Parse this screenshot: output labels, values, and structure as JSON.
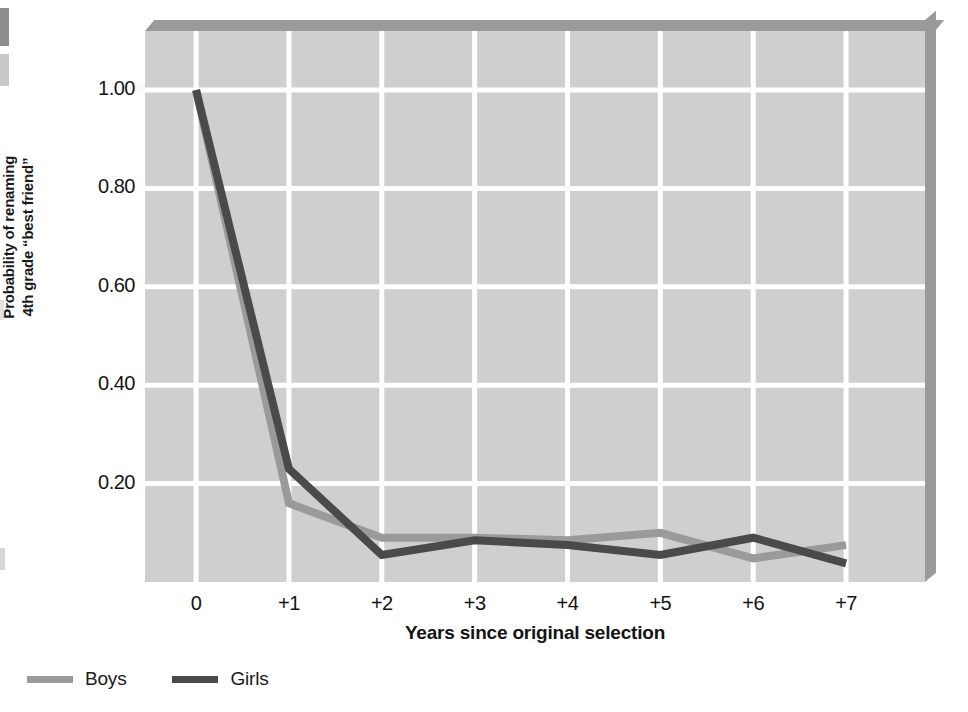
{
  "chart_data": {
    "type": "line",
    "title": "",
    "xlabel": "Years since original selection",
    "ylabel": "Probability of renaming 4th grade “best friend”",
    "ylabel_line1": "Probability of renaming",
    "ylabel_line2": "4th grade “best friend”",
    "categories": [
      "0",
      "+1",
      "+2",
      "+3",
      "+4",
      "+5",
      "+6",
      "+7"
    ],
    "x": [
      0,
      1,
      2,
      3,
      4,
      5,
      6,
      7
    ],
    "xlim": [
      -0.55,
      7.85
    ],
    "ylim": [
      0,
      1.12
    ],
    "yticks": [
      1.0,
      0.8,
      0.6,
      0.4,
      0.2
    ],
    "ytick_labels": [
      "1.00",
      "0.80",
      "0.60",
      "0.40",
      "0.20"
    ],
    "grid": true,
    "grid_color": "#ffffff",
    "plot_background": "#cfcfcf",
    "legend_position": "below-left",
    "series": [
      {
        "name": "Boys",
        "color": "#9a9a9a",
        "values": [
          1.0,
          0.16,
          0.09,
          0.09,
          0.085,
          0.1,
          0.048,
          0.075
        ]
      },
      {
        "name": "Girls",
        "color": "#4a4a4a",
        "values": [
          1.0,
          0.23,
          0.055,
          0.085,
          0.075,
          0.055,
          0.09,
          0.038
        ]
      }
    ]
  },
  "legend": {
    "entries": [
      {
        "label": "Boys",
        "color": "#9a9a9a"
      },
      {
        "label": "Girls",
        "color": "#4a4a4a"
      }
    ]
  },
  "axes": {
    "y_title_line1": "Probability of renaming",
    "y_title_line2": "4th grade “best friend”",
    "x_title": "Years since original selection",
    "y_labels": [
      "1.00",
      "0.80",
      "0.60",
      "0.40",
      "0.20"
    ],
    "x_labels": [
      "0",
      "+1",
      "+2",
      "+3",
      "+4",
      "+5",
      "+6",
      "+7"
    ]
  }
}
